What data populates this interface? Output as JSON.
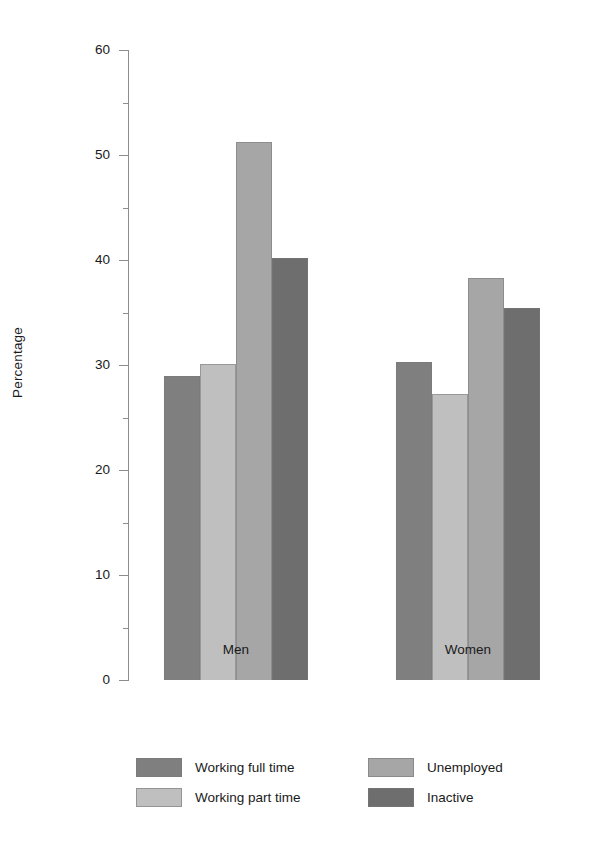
{
  "chart_data": {
    "type": "bar",
    "title": "",
    "xlabel": "",
    "ylabel": "Percentage",
    "ylim": [
      0,
      60
    ],
    "ytick_step": 10,
    "yminor_step": 5,
    "grid": false,
    "legend_position": "bottom",
    "categories": [
      "Men",
      "Women"
    ],
    "ytick_labels": [
      "0",
      "10",
      "20",
      "30",
      "40",
      "50",
      "60"
    ],
    "series": [
      {
        "name": "Working full time",
        "color": "#7f7f7f",
        "values": [
          29.0,
          30.3
        ]
      },
      {
        "name": "Working part time",
        "color": "#bfbfbf",
        "values": [
          30.1,
          27.2
        ]
      },
      {
        "name": "Unemployed",
        "color": "#a6a6a6",
        "values": [
          51.2,
          38.3
        ]
      },
      {
        "name": "Inactive",
        "color": "#6e6e6e",
        "values": [
          40.2,
          35.4
        ]
      }
    ]
  },
  "axis": {
    "y_title": "Percentage"
  },
  "legend": {
    "entries": [
      {
        "label": "Working full time"
      },
      {
        "label": "Unemployed"
      },
      {
        "label": "Working part time"
      },
      {
        "label": "Inactive"
      }
    ]
  }
}
